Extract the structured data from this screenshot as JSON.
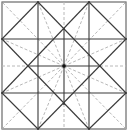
{
  "diagram": {
    "type": "crease-pattern",
    "width": 131,
    "height": 131,
    "colors": {
      "background": "#ffffff",
      "frame": "#6a6a6a",
      "solid": "#3a3a3a",
      "dashed": "#b8b8b8",
      "center_dot": "#111111"
    },
    "frame": {
      "x1": 2,
      "y1": 2,
      "x2": 126,
      "y2": 129
    },
    "center": {
      "x": 64,
      "y": 66
    },
    "solid_lines": [
      [
        38,
        2,
        38,
        129
      ],
      [
        89,
        2,
        89,
        129
      ],
      [
        2,
        39,
        126,
        39
      ],
      [
        2,
        93,
        126,
        93
      ],
      [
        38,
        2,
        2,
        39
      ],
      [
        89,
        2,
        126,
        39
      ],
      [
        2,
        93,
        38,
        129
      ],
      [
        126,
        93,
        89,
        129
      ],
      [
        38,
        2,
        126,
        93
      ],
      [
        89,
        2,
        2,
        93
      ],
      [
        2,
        39,
        89,
        129
      ],
      [
        126,
        39,
        38,
        129
      ],
      [
        64,
        29,
        64,
        104
      ],
      [
        28,
        66,
        100,
        66
      ]
    ],
    "dashed_lines": [
      [
        64,
        2,
        64,
        29
      ],
      [
        64,
        104,
        64,
        129
      ],
      [
        2,
        66,
        28,
        66
      ],
      [
        100,
        66,
        126,
        66
      ],
      [
        64,
        66,
        2,
        2
      ],
      [
        64,
        66,
        126,
        2
      ],
      [
        64,
        66,
        2,
        129
      ],
      [
        64,
        66,
        126,
        129
      ],
      [
        64,
        66,
        38,
        2
      ],
      [
        64,
        66,
        89,
        2
      ],
      [
        64,
        66,
        38,
        129
      ],
      [
        64,
        66,
        89,
        129
      ],
      [
        64,
        66,
        2,
        39
      ],
      [
        64,
        66,
        2,
        93
      ],
      [
        64,
        66,
        126,
        39
      ],
      [
        64,
        66,
        126,
        93
      ]
    ],
    "vertices": [
      [
        38,
        2
      ],
      [
        89,
        2
      ],
      [
        2,
        39
      ],
      [
        126,
        39
      ],
      [
        2,
        93
      ],
      [
        126,
        93
      ],
      [
        38,
        129
      ],
      [
        89,
        129
      ],
      [
        64,
        29
      ],
      [
        28,
        66
      ],
      [
        100,
        66
      ],
      [
        64,
        104
      ]
    ]
  }
}
